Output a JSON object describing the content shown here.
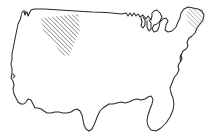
{
  "figure": {
    "kind": "line-drawing-map",
    "title": "United States outline map",
    "width_px": 213,
    "height_px": 140
  },
  "colors": {
    "background": "#ffffff",
    "outline_stroke": "#2b2b2b",
    "hatch_primary": "#2b2b2b",
    "hatch_secondary": "#555555"
  },
  "style": {
    "outline_stroke_width": 1.05,
    "hatch_angle_deg": 45,
    "hatch_spacing_px": 3.1,
    "hatch_line_width": 0.85
  },
  "regions": [
    {
      "name": "contiguous-united-states",
      "label": "Contiguous United States",
      "shaded": false
    },
    {
      "name": "northwest-interior-hatched",
      "label": "Northwest interior hatched area",
      "shaded": true,
      "shading": "diagonal-hatch",
      "approx_bounds_px": {
        "x": 40,
        "y": 17,
        "w": 40,
        "h": 40
      }
    },
    {
      "name": "northeast-corner-hatched",
      "label": "Northeast corner hatched area",
      "shaded": true,
      "shading": "diagonal-hatch-light",
      "approx_bounds_px": {
        "x": 183,
        "y": 7,
        "w": 22,
        "h": 22
      }
    }
  ],
  "features": [
    {
      "name": "pacific-coast",
      "label": "Pacific coast"
    },
    {
      "name": "puget-sound-notch",
      "label": "Puget Sound notch"
    },
    {
      "name": "northern-border",
      "label": "Northern border"
    },
    {
      "name": "great-lakes",
      "label": "Great Lakes"
    },
    {
      "name": "new-england",
      "label": "New England"
    },
    {
      "name": "atlantic-coast",
      "label": "Atlantic coast"
    },
    {
      "name": "chesapeake-bay",
      "label": "Chesapeake Bay"
    },
    {
      "name": "florida-peninsula",
      "label": "Florida peninsula"
    },
    {
      "name": "gulf-coast",
      "label": "Gulf coast"
    },
    {
      "name": "mississippi-delta",
      "label": "Mississippi delta"
    },
    {
      "name": "texas-border",
      "label": "Texas southern border"
    },
    {
      "name": "southwest-border",
      "label": "Southwest border"
    },
    {
      "name": "baja-notch",
      "label": "Southern California coastal notch"
    }
  ]
}
